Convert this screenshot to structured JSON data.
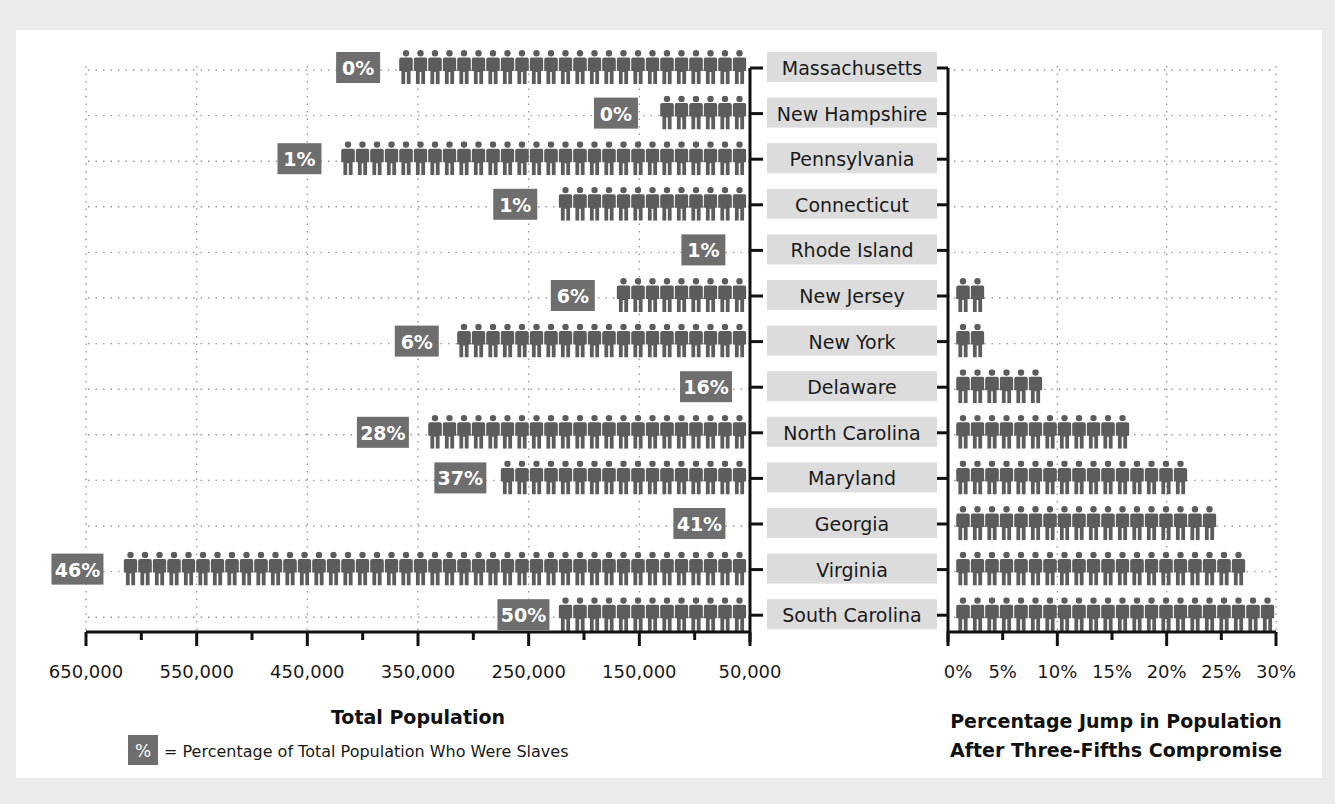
{
  "chart_data": [
    {
      "type": "bar",
      "orientation": "horizontal-left",
      "title": "",
      "xlabel": "Total Population",
      "ylabel": "",
      "xlim": [
        650000,
        50000
      ],
      "x_ticks": [
        "650,000",
        "550,000",
        "450,000",
        "350,000",
        "250,000",
        "150,000",
        "50,000"
      ],
      "x_tick_values": [
        650000,
        550000,
        450000,
        350000,
        250000,
        150000,
        50000
      ],
      "grid": true,
      "marker": "person-icon",
      "categories": [
        "Massachusetts",
        "New Hampshire",
        "Pennsylvania",
        "Connecticut",
        "Rhode Island",
        "New Jersey",
        "New York",
        "Delaware",
        "North Carolina",
        "Maryland",
        "Georgia",
        "Virginia",
        "South Carolina"
      ],
      "series": [
        {
          "name": "Total Population",
          "values": [
            377000,
            144000,
            430000,
            235000,
            65000,
            183000,
            324000,
            59000,
            351000,
            281000,
            65000,
            627000,
            224000
          ]
        }
      ],
      "annotations": {
        "label": "Percentage of Total Population Who Were Slaves",
        "values": [
          "0%",
          "0%",
          "1%",
          "1%",
          "1%",
          "6%",
          "6%",
          "16%",
          "28%",
          "37%",
          "41%",
          "46%",
          "50%"
        ]
      },
      "legend": {
        "symbol": "%",
        "text": "= Percentage of Total Population Who Were Slaves",
        "position": "bottom-left"
      }
    },
    {
      "type": "bar",
      "orientation": "horizontal",
      "title": "",
      "xlabel": "Percentage Jump in Population After Three-Fifths Compromise",
      "ylabel": "",
      "xlim": [
        0,
        30
      ],
      "x_ticks": [
        "0%",
        "5%",
        "10%",
        "15%",
        "20%",
        "25%",
        "30%"
      ],
      "x_tick_values": [
        0,
        5,
        10,
        15,
        20,
        25,
        30
      ],
      "grid": true,
      "marker": "person-icon",
      "categories": [
        "Massachusetts",
        "New Hampshire",
        "Pennsylvania",
        "Connecticut",
        "Rhode Island",
        "New Jersey",
        "New York",
        "Delaware",
        "North Carolina",
        "Maryland",
        "Georgia",
        "Virginia",
        "South Carolina"
      ],
      "series": [
        {
          "name": "Percentage Jump",
          "values": [
            0,
            0,
            0.5,
            0.5,
            0.5,
            4.5,
            4.5,
            10,
            16.7,
            22,
            24.8,
            28.2,
            30
          ]
        }
      ]
    }
  ],
  "rows": [
    {
      "state": "Massachusetts",
      "pct_slaves": "0%",
      "population": 377000,
      "jump": 0
    },
    {
      "state": "New Hampshire",
      "pct_slaves": "0%",
      "population": 144000,
      "jump": 0
    },
    {
      "state": "Pennsylvania",
      "pct_slaves": "1%",
      "population": 430000,
      "jump": 0.5
    },
    {
      "state": "Connecticut",
      "pct_slaves": "1%",
      "population": 235000,
      "jump": 0.5
    },
    {
      "state": "Rhode Island",
      "pct_slaves": "1%",
      "population": 65000,
      "jump": 0.5
    },
    {
      "state": "New Jersey",
      "pct_slaves": "6%",
      "population": 183000,
      "jump": 4.5
    },
    {
      "state": "New York",
      "pct_slaves": "6%",
      "population": 324000,
      "jump": 4.5
    },
    {
      "state": "Delaware",
      "pct_slaves": "16%",
      "population": 59000,
      "jump": 10
    },
    {
      "state": "North Carolina",
      "pct_slaves": "28%",
      "population": 351000,
      "jump": 16.7
    },
    {
      "state": "Maryland",
      "pct_slaves": "37%",
      "population": 281000,
      "jump": 22
    },
    {
      "state": "Georgia",
      "pct_slaves": "41%",
      "population": 65000,
      "jump": 24.8
    },
    {
      "state": "Virginia",
      "pct_slaves": "46%",
      "population": 627000,
      "jump": 28.2
    },
    {
      "state": "South Carolina",
      "pct_slaves": "50%",
      "population": 224000,
      "jump": 30
    }
  ],
  "left_axis": {
    "title": "Total Population",
    "ticks": [
      "650,000",
      "550,000",
      "450,000",
      "350,000",
      "250,000",
      "150,000",
      "50,000"
    ]
  },
  "right_axis": {
    "title_line1": "Percentage Jump in Population",
    "title_line2": "After Three-Fifths Compromise",
    "ticks": [
      "0%",
      "5%",
      "10%",
      "15%",
      "20%",
      "25%",
      "30%"
    ]
  },
  "legend": {
    "symbol": "%",
    "text": "= Percentage of Total Population Who Were Slaves"
  },
  "colors": {
    "icon": "#5c5c5c",
    "badge": "#6e6e6e",
    "state_box": "#dcdcdc",
    "page_bg": "#ebebeb",
    "panel_bg": "#ffffff"
  }
}
